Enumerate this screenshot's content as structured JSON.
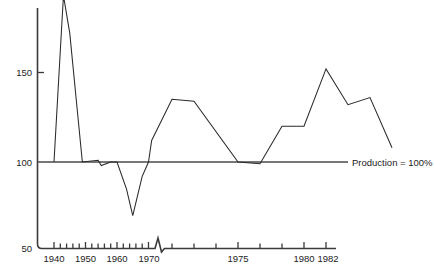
{
  "chart_data": {
    "type": "line",
    "title": "",
    "subtitle": "",
    "xlabel": "",
    "ylabel": "",
    "grid": false,
    "legend_position": "none",
    "xlim": [
      1938,
      1982.5
    ],
    "ylim": [
      50,
      196
    ],
    "y_ticks": [
      50,
      100,
      150
    ],
    "y_tick_labels": [
      "50",
      "100",
      "150"
    ],
    "x_ticks": [
      1940,
      1942,
      1944,
      1946,
      1948,
      1950,
      1952,
      1954,
      1956,
      1958,
      1960,
      1962,
      1964,
      1966,
      1968,
      1970,
      1972,
      1974,
      1976,
      1978,
      1980,
      1982
    ],
    "x_tick_labels": [
      {
        "value": 1940,
        "label": "1940"
      },
      {
        "value": 1950,
        "label": "1950"
      },
      {
        "value": 1960,
        "label": "1960"
      },
      {
        "value": 1970,
        "label": "1970"
      },
      {
        "value": 1975,
        "label": "1975"
      },
      {
        "value": 1980,
        "label": "1980"
      },
      {
        "value": 1982,
        "label": "1982"
      }
    ],
    "axis_break": {
      "at": 1971,
      "note": "zig-zag break mark on x-axis"
    },
    "annotations": [
      {
        "text": "Production = 100%",
        "x": 1982.5,
        "y": 100,
        "leader_line": true
      }
    ],
    "reference_line": {
      "y": 100,
      "label": "Production = 100%"
    },
    "series": [
      {
        "name": "Production index",
        "x": [
          1940,
          1943,
          1945,
          1949,
          1954,
          1955,
          1958,
          1960,
          1963,
          1965,
          1968,
          1970,
          1971,
          1972,
          1973,
          1975,
          1976,
          1977,
          1978,
          1979,
          1980,
          1981,
          1982
        ],
        "values": [
          100,
          193,
          172,
          100,
          101,
          98,
          100,
          100,
          85,
          70,
          92,
          100,
          112,
          135,
          134,
          100,
          99,
          120,
          120,
          152,
          132,
          136,
          108
        ]
      }
    ]
  }
}
